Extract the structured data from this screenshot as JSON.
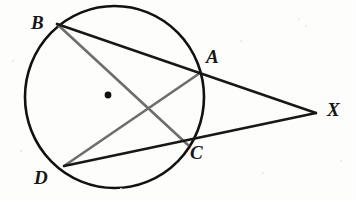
{
  "figure": {
    "background_color": "#fdfdfc",
    "width": 356,
    "height": 200,
    "circle": {
      "name": "circle-outline",
      "cx": 114.5,
      "cy": 97,
      "rx": 89.5,
      "ry": 91,
      "stroke_color": "#111111",
      "stroke_width": 2.6,
      "fill": "none"
    },
    "center_dot": {
      "name": "circle-center-dot",
      "cx": 108,
      "cy": 95,
      "r": 3.4,
      "color": "#111111"
    },
    "points": [
      {
        "id": "B",
        "label": "B",
        "x": 57,
        "y": 24,
        "label_x": 31,
        "label_y": 13,
        "on_circle": true
      },
      {
        "id": "A",
        "label": "A",
        "x": 199,
        "y": 72,
        "label_x": 206,
        "label_y": 47,
        "on_circle": true
      },
      {
        "id": "C",
        "label": "C",
        "x": 187,
        "y": 144,
        "label_x": 190,
        "label_y": 143,
        "on_circle": true
      },
      {
        "id": "D",
        "label": "D",
        "x": 64,
        "y": 166,
        "label_x": 34,
        "label_y": 168,
        "on_circle": true
      },
      {
        "id": "X",
        "label": "X",
        "x": 316,
        "y": 113,
        "label_x": 327,
        "label_y": 100,
        "on_circle": false
      }
    ],
    "segments": [
      {
        "name": "secant-line-b-a-x",
        "from": "B",
        "to": "X",
        "through": "A",
        "color": "#171717",
        "width": 2.4,
        "x1": 57,
        "y1": 24,
        "x2": 316,
        "y2": 113
      },
      {
        "name": "secant-line-d-c-x",
        "from": "D",
        "to": "X",
        "through": "C",
        "color": "#171717",
        "width": 2.4,
        "x1": 64,
        "y1": 166,
        "x2": 316,
        "y2": 113
      },
      {
        "name": "chord-b-c",
        "from": "B",
        "to": "C",
        "color": "#6d6d6d",
        "width": 2.6,
        "x1": 57,
        "y1": 24,
        "x2": 188,
        "y2": 145
      },
      {
        "name": "chord-d-a",
        "from": "D",
        "to": "A",
        "color": "#6d6d6d",
        "width": 2.6,
        "x1": 64,
        "y1": 166,
        "x2": 200,
        "y2": 73
      }
    ],
    "intersection": {
      "name": "chord-intersection-point",
      "x": 150,
      "y": 110
    },
    "specks": [
      {
        "x": 298,
        "y": 18,
        "size": 2
      },
      {
        "x": 305,
        "y": 25,
        "size": 1.5
      },
      {
        "x": 262,
        "y": 172,
        "size": 2
      },
      {
        "x": 120,
        "y": 188,
        "size": 1.5
      },
      {
        "x": 20,
        "y": 150,
        "size": 1.5
      },
      {
        "x": 340,
        "y": 160,
        "size": 2
      },
      {
        "x": 240,
        "y": 40,
        "size": 1.5
      },
      {
        "x": 12,
        "y": 60,
        "size": 1.5
      }
    ]
  }
}
